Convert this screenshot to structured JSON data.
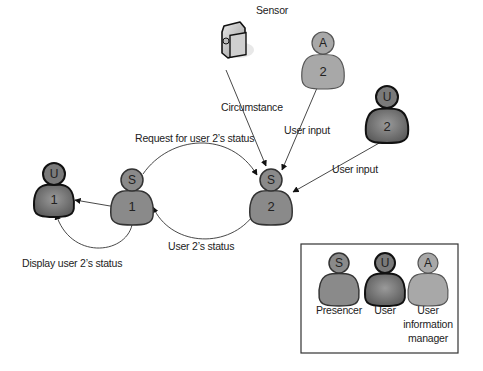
{
  "diagram": {
    "colors": {
      "presencer": "#8a8a8a",
      "user": "#6a6a6a",
      "user_info_manager": "#a8a8a8",
      "outline": "#3a3a3a",
      "user_outline": "#111111",
      "line": "#333333"
    },
    "nodes": [
      {
        "id": "sensor",
        "type": "sensor",
        "label": "Sensor",
        "icon": "video-camera-icon"
      },
      {
        "id": "A2",
        "type": "user_info_manager",
        "head": "A",
        "body": "2"
      },
      {
        "id": "U2",
        "type": "user",
        "head": "U",
        "body": "2"
      },
      {
        "id": "S2",
        "type": "presencer",
        "head": "S",
        "body": "2"
      },
      {
        "id": "S1",
        "type": "presencer",
        "head": "S",
        "body": "1"
      },
      {
        "id": "U1",
        "type": "user",
        "head": "U",
        "body": "1"
      }
    ],
    "edges": [
      {
        "from": "sensor",
        "to": "S2",
        "label": "Circumstance"
      },
      {
        "from": "A2",
        "to": "S2",
        "label": "User input"
      },
      {
        "from": "U2",
        "to": "S2",
        "label": "User input"
      },
      {
        "from": "S1",
        "to": "S2",
        "label": "Request for user 2’s status"
      },
      {
        "from": "S2",
        "to": "S1",
        "label": "User 2’s status"
      },
      {
        "from": "S1",
        "to": "U1",
        "label": ""
      },
      {
        "from": "S1",
        "to": "U1",
        "label": "Display user 2’s status"
      }
    ],
    "legend": {
      "items": [
        {
          "head": "S",
          "label": "Presencer"
        },
        {
          "head": "U",
          "label": "User"
        },
        {
          "head": "A",
          "label_lines": [
            "User",
            "information",
            "manager"
          ]
        }
      ]
    }
  }
}
